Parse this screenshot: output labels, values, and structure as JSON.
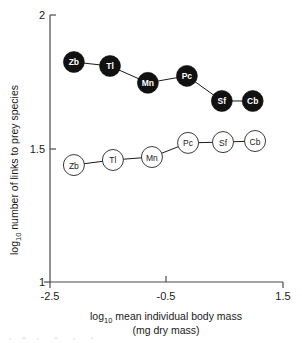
{
  "chart_data": {
    "type": "scatter",
    "title": "",
    "xlabel_line1": "log10 mean individual body mass",
    "xlabel_line2": "(mg dry mass)",
    "xlabel_prefix": "log",
    "xlabel_sub": "10",
    "xlabel_rest": " mean individual body mass",
    "ylabel_prefix": "log",
    "ylabel_sub": "10",
    "ylabel_rest": " number of links to prey species",
    "xlim": [
      -2.5,
      1.5
    ],
    "ylim": [
      1.0,
      2.0
    ],
    "xticks": [
      "-2.5",
      "-0.5",
      "1.5"
    ],
    "xtick_values": [
      -2.5,
      -0.5,
      1.5
    ],
    "yticks": [
      "2",
      "1.5",
      "1"
    ],
    "ytick_values": [
      2.0,
      1.5,
      1.0
    ],
    "grid": false,
    "legend": "none",
    "series": [
      {
        "name": "links to prey species (filled)",
        "marker": "filled-circle",
        "color": "#111111",
        "label_color": "#ffffff",
        "points": [
          {
            "label": "Zb",
            "x": -2.09,
            "y": 1.824
          },
          {
            "label": "Tl",
            "x": -1.47,
            "y": 1.809
          },
          {
            "label": "Mn",
            "x": -0.82,
            "y": 1.746
          },
          {
            "label": "Pc",
            "x": -0.15,
            "y": 1.772
          },
          {
            "label": "Sf",
            "x": 0.45,
            "y": 1.678
          },
          {
            "label": "Cb",
            "x": 0.98,
            "y": 1.678
          }
        ]
      },
      {
        "name": "links to predator species (open)",
        "marker": "open-circle",
        "color": "#ffffff",
        "label_color": "#1a1a1a",
        "points": [
          {
            "label": "Zb",
            "x": -2.09,
            "y": 1.438
          },
          {
            "label": "Tl",
            "x": -1.42,
            "y": 1.457
          },
          {
            "label": "Mn",
            "x": -0.75,
            "y": 1.468
          },
          {
            "label": "Pc",
            "x": -0.13,
            "y": 1.521
          },
          {
            "label": "Sf",
            "x": 0.47,
            "y": 1.524
          },
          {
            "label": "Cb",
            "x": 1.02,
            "y": 1.528
          }
        ]
      }
    ]
  }
}
